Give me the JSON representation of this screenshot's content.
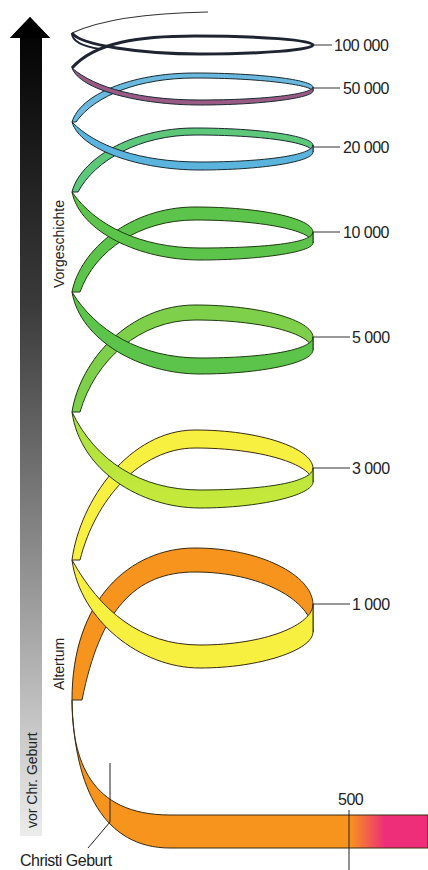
{
  "diagram": {
    "type": "spiral-timeline",
    "axis": {
      "arrow_label": "vor Chr. Geburt",
      "gradient_top": "#000000",
      "gradient_bottom": "#e8e8e8"
    },
    "eras": [
      {
        "label": "Vorgeschichte"
      },
      {
        "label": "Altertum"
      }
    ],
    "rings": [
      {
        "value": "100 000",
        "color": "#1f2530"
      },
      {
        "value": "50 000",
        "color": "#6aaed8"
      },
      {
        "value": "20 000",
        "color": "#5ab8e0"
      },
      {
        "value": "10 000",
        "color": "#5cc44a"
      },
      {
        "value": "5 000",
        "color": "#5cc44a"
      },
      {
        "value": "3 000",
        "color": "#a8e040"
      },
      {
        "value": "1 000",
        "color": "#f8f040"
      }
    ],
    "markers": {
      "christ_birth": "Christi Geburt",
      "year_500": "500"
    },
    "colors": {
      "orange": "#f7941d",
      "yellow": "#f8f040",
      "pink": "#ee2e78",
      "green": "#5cc44a",
      "blue": "#5ab4de",
      "purple": "#9a5a86",
      "dark": "#1f2530"
    }
  }
}
